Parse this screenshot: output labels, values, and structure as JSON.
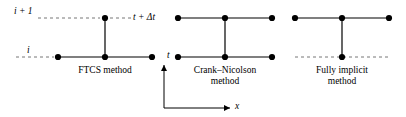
{
  "figure": {
    "background_color": "#ffffff",
    "line_color": "#000000",
    "node_color": "#000000"
  },
  "axes": {
    "x_axis_label": "x",
    "t_axis_label": "t",
    "grid_line_style": "dashed",
    "x_axis": {
      "x1": 164,
      "y1": 108,
      "x2": 236,
      "y2": 108,
      "arrow": "right"
    },
    "t_axis": {
      "x1": 164,
      "y1": 108,
      "x2": 164,
      "y2": 62,
      "arrow": "up"
    }
  },
  "levels": [
    {
      "id": "i-plus-1",
      "label": "i + 1",
      "y": 18,
      "label_x": 18,
      "label_y": 12
    },
    {
      "id": "i",
      "label": "i",
      "y": 57,
      "label_x": 28,
      "label_y": 51
    }
  ],
  "time_markers": [
    {
      "id": "t-plus-delta-t",
      "label": "t + Δt",
      "x": 132,
      "y": 18
    },
    {
      "id": "t",
      "label": "t",
      "x": 167,
      "y": 57
    }
  ],
  "stencils": [
    {
      "id": "ftcs",
      "name": "FTCS method",
      "label": "FTCS method",
      "label_line_2": "",
      "label_x": 105,
      "label_y": 67,
      "center_x": 105,
      "top_nodes": [
        {
          "x": 105,
          "y": 18
        }
      ],
      "bottom_nodes": [
        {
          "x": 58,
          "y": 57
        },
        {
          "x": 105,
          "y": 57
        },
        {
          "x": 152,
          "y": 57
        }
      ],
      "horizontal_top": null,
      "horizontal_bottom": {
        "x1": 58,
        "x2": 152,
        "y": 57
      },
      "vertical": {
        "x": 105,
        "y1": 18,
        "y2": 57
      }
    },
    {
      "id": "crank-nicolson",
      "name": "Crank–Nicolson method",
      "label": "Crank–Nicolson",
      "label_line_2": "method",
      "label_x": 225,
      "label_y": 67,
      "center_x": 225,
      "top_nodes": [
        {
          "x": 178,
          "y": 18
        },
        {
          "x": 225,
          "y": 18
        },
        {
          "x": 272,
          "y": 18
        }
      ],
      "bottom_nodes": [
        {
          "x": 178,
          "y": 57
        },
        {
          "x": 225,
          "y": 57
        },
        {
          "x": 272,
          "y": 57
        }
      ],
      "horizontal_top": {
        "x1": 178,
        "x2": 272,
        "y": 18
      },
      "horizontal_bottom": {
        "x1": 178,
        "x2": 272,
        "y": 57
      },
      "vertical": {
        "x": 225,
        "y1": 18,
        "y2": 57
      }
    },
    {
      "id": "fully-implicit",
      "name": "Fully implicit method",
      "label": "Fully implicit",
      "label_line_2": "method",
      "label_x": 342,
      "label_y": 67,
      "center_x": 342,
      "top_nodes": [
        {
          "x": 295,
          "y": 18
        },
        {
          "x": 342,
          "y": 18
        },
        {
          "x": 389,
          "y": 18
        }
      ],
      "bottom_nodes": [
        {
          "x": 342,
          "y": 57
        }
      ],
      "horizontal_top": {
        "x1": 295,
        "x2": 389,
        "y": 18
      },
      "horizontal_bottom": null,
      "vertical": {
        "x": 342,
        "y1": 18,
        "y2": 57
      }
    }
  ],
  "dashed_segments": [
    {
      "id": "top-dash-left",
      "y": 18,
      "x1": 38,
      "x2": 105
    },
    {
      "id": "top-dash-mid",
      "y": 18,
      "x1": 105,
      "x2": 178
    },
    {
      "id": "bottom-dash-left",
      "y": 57,
      "x1": 16,
      "x2": 58
    },
    {
      "id": "bottom-dash-right",
      "y": 57,
      "x1": 295,
      "x2": 389
    }
  ]
}
